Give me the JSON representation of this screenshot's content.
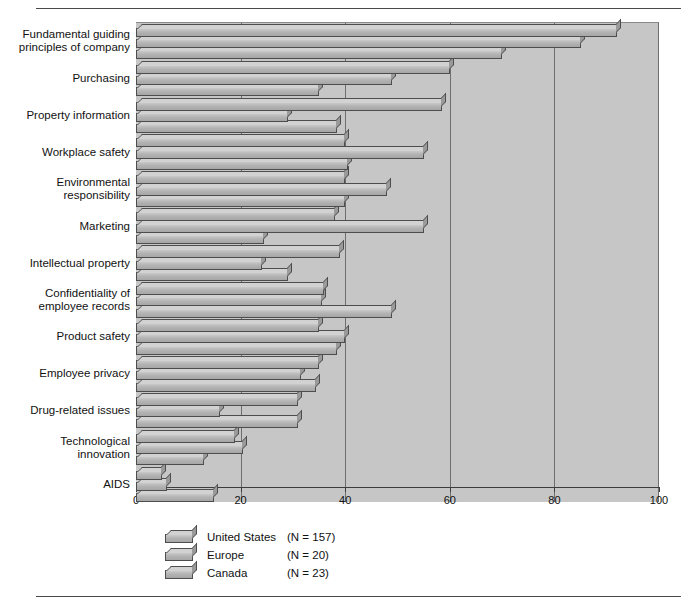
{
  "chart_data": {
    "type": "bar",
    "orientation": "horizontal",
    "title": "",
    "subtitle": "",
    "xlabel": "",
    "ylabel": "",
    "xlim": [
      0,
      100
    ],
    "xticks": [
      0,
      20,
      40,
      60,
      80,
      100
    ],
    "grid": true,
    "legend_position": "bottom-left",
    "categories": [
      "Fundamental guiding\nprinciples of company",
      "Purchasing",
      "Property information",
      "Workplace safety",
      "Environmental\nresponsibility",
      "Marketing",
      "Intellectual property",
      "Confidentiality of\nemployee records",
      "Product safety",
      "Employee privacy",
      "Drug-related issues",
      "Technological\ninnovation",
      "AIDS"
    ],
    "series": [
      {
        "name": "United States",
        "n_label": "(N = 157)",
        "values": [
          92,
          60,
          58.5,
          40,
          40,
          38,
          39,
          36,
          35,
          35,
          31,
          19,
          5
        ]
      },
      {
        "name": "Europe",
        "n_label": "(N = 20)",
        "values": [
          85,
          49,
          29,
          55,
          48,
          55,
          24,
          35.5,
          40,
          31.5,
          16,
          20.5,
          6
        ]
      },
      {
        "name": "Canada",
        "n_label": "(N = 23)",
        "values": [
          70,
          35,
          38.5,
          40.5,
          40,
          24.5,
          29,
          49,
          38.5,
          34.5,
          31,
          13,
          15
        ]
      }
    ]
  },
  "legend": {
    "rows": [
      {
        "name": "United States",
        "n": "(N = 157)"
      },
      {
        "name": "Europe",
        "n": "(N = 20)"
      },
      {
        "name": "Canada",
        "n": "(N = 23)"
      }
    ]
  },
  "axis": {
    "tick_labels": [
      "0",
      "20",
      "40",
      "60",
      "80",
      "100"
    ]
  }
}
